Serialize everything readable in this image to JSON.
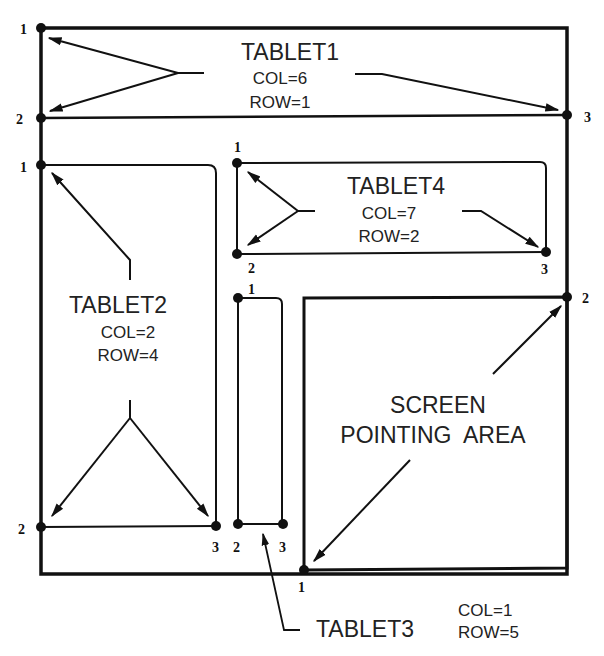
{
  "diagram": {
    "colors": {
      "line": "#111111",
      "text": "#222222",
      "background": "#ffffff"
    },
    "outer_frame": {
      "corners": [
        "1",
        "2",
        "3"
      ]
    },
    "tablets": [
      {
        "name": "TABLET1",
        "col": "COL=6",
        "row": "ROW=1",
        "points": [
          "1",
          "2",
          "3"
        ]
      },
      {
        "name": "TABLET2",
        "col": "COL=2",
        "row": "ROW=4",
        "points": [
          "1",
          "2",
          "3"
        ]
      },
      {
        "name": "TABLET3",
        "col": "COL=1",
        "row": "ROW=5",
        "points": [
          "1",
          "2",
          "3"
        ]
      },
      {
        "name": "TABLET4",
        "col": "COL=7",
        "row": "ROW=2",
        "points": [
          "1",
          "2",
          "3"
        ]
      }
    ],
    "screen_area": {
      "line1": "SCREEN",
      "line2": "POINTING  AREA",
      "points": [
        "1",
        "2"
      ]
    }
  }
}
